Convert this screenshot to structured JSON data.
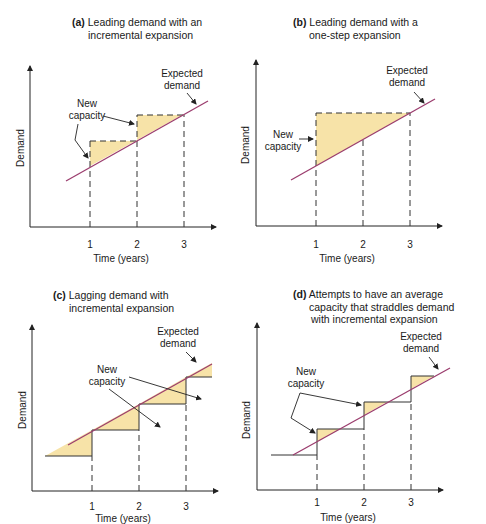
{
  "figure": {
    "panels": [
      {
        "id": "a",
        "letter": "(a)",
        "title_lines": [
          "Leading demand with an",
          "incremental expansion"
        ],
        "ylabel": "Demand",
        "xlabel": "Time (years)",
        "ticks": [
          "1",
          "2",
          "3"
        ],
        "annotations": {
          "new_capacity": [
            "New",
            "capacity"
          ],
          "expected_demand": [
            "Expected",
            "demand"
          ]
        }
      },
      {
        "id": "b",
        "letter": "(b)",
        "title_lines": [
          "Leading demand with a",
          "one-step expansion"
        ],
        "ylabel": "Demand",
        "xlabel": "Time (years)",
        "ticks": [
          "1",
          "2",
          "3"
        ],
        "annotations": {
          "new_capacity": [
            "New",
            "capacity"
          ],
          "expected_demand": [
            "Expected",
            "demand"
          ]
        }
      },
      {
        "id": "c",
        "letter": "(c)",
        "title_lines": [
          "Lagging demand with",
          "incremental expansion"
        ],
        "ylabel": "Demand",
        "xlabel": "Time (years)",
        "ticks": [
          "1",
          "2",
          "3"
        ],
        "annotations": {
          "new_capacity": [
            "New",
            "capacity"
          ],
          "expected_demand": [
            "Expected",
            "demand"
          ]
        }
      },
      {
        "id": "d",
        "letter": "(d)",
        "title_lines": [
          "Attempts to have an average",
          "capacity that straddles demand",
          "with incremental expansion"
        ],
        "ylabel": "Demand",
        "xlabel": "Time (years)",
        "ticks": [
          "1",
          "2",
          "3"
        ],
        "annotations": {
          "new_capacity": [
            "New",
            "capacity"
          ],
          "expected_demand": [
            "Expected",
            "demand"
          ]
        }
      }
    ],
    "colors": {
      "demand_line": "#9b3d6e",
      "fill": "#f7e3a8",
      "axis": "#222222",
      "capacity_line": "#333333"
    }
  }
}
